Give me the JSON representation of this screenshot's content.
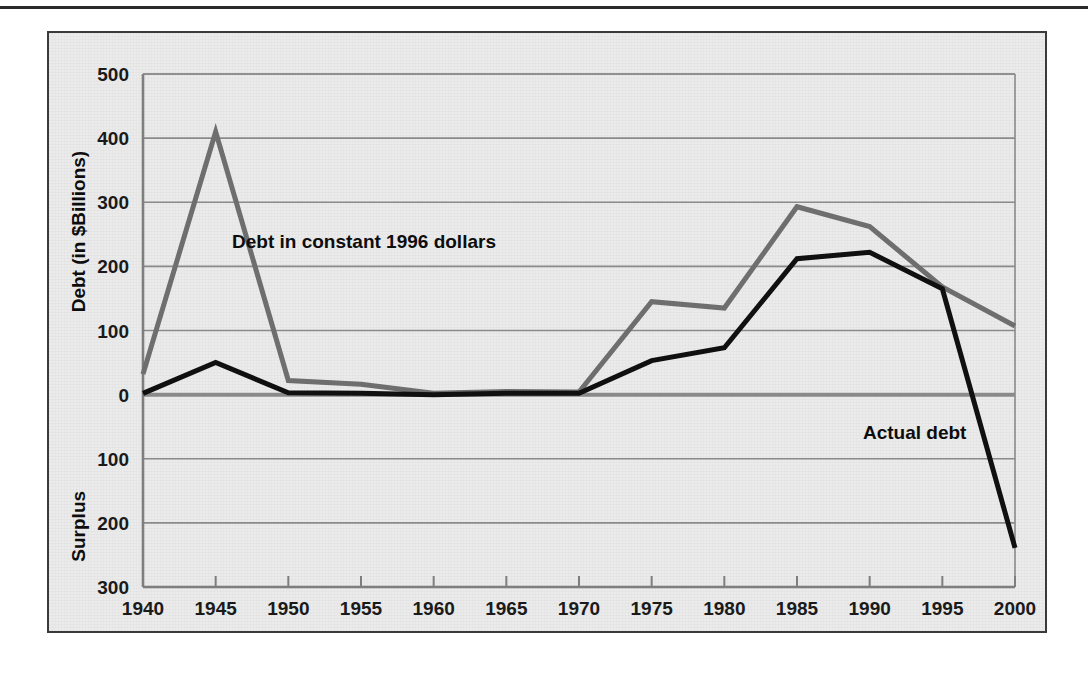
{
  "figure": {
    "background_color": "#ebebeb",
    "frame_color": "#3a3a3a",
    "top_rule_color": "#2a2a2a"
  },
  "chart_data": {
    "type": "line",
    "title": "",
    "xlabel": "",
    "ylabel": "Debt (in $Billions)",
    "ylabel_lower": "Surplus",
    "x": [
      1940,
      1945,
      1950,
      1955,
      1960,
      1965,
      1970,
      1975,
      1980,
      1985,
      1990,
      1995,
      2000
    ],
    "xticklabels": [
      "1940",
      "1945",
      "1950",
      "1955",
      "1960",
      "1965",
      "1970",
      "1975",
      "1980",
      "1985",
      "1990",
      "1995",
      "2000"
    ],
    "yticks": [
      500,
      400,
      300,
      200,
      100,
      0,
      -100,
      -200,
      -300
    ],
    "yticklabels": [
      "500",
      "400",
      "300",
      "200",
      "100",
      "0",
      "100",
      "200",
      "300"
    ],
    "ylim": [
      -300,
      500
    ],
    "xlim": [
      1940,
      2000
    ],
    "grid": true,
    "grid_color": "#8a8a8a",
    "legend": "annotations",
    "series": [
      {
        "name": "Debt in constant 1996 dollars",
        "color": "#6e6e6e",
        "width": 5,
        "values": [
          32,
          410,
          22,
          16,
          2,
          5,
          4,
          145,
          135,
          293,
          262,
          168,
          107
        ]
      },
      {
        "name": "Actual debt",
        "color": "#101010",
        "width": 5,
        "values": [
          2,
          50,
          3,
          2,
          0,
          2,
          2,
          53,
          73,
          212,
          222,
          165,
          -239
        ]
      }
    ],
    "annotations": [
      {
        "text": "Debt in constant 1996 dollars",
        "series": "Debt in constant 1996 dollars",
        "x_px": 230,
        "y_px": 246
      },
      {
        "text": "Actual debt",
        "series": "Actual debt",
        "x_px": 861,
        "y_px": 437
      }
    ]
  }
}
